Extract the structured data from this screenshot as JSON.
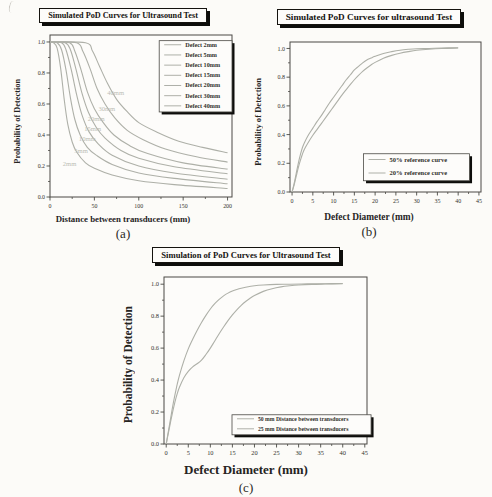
{
  "colors": {
    "paper": "#fdfcfa",
    "axis": "#4a4944",
    "tick_text": "#33322d",
    "curve": "#aeb0a8",
    "inline_label": "#bcbdb5",
    "legend_shadow": "#0d0d0b",
    "title_text": "#151310"
  },
  "chart_data": [
    {
      "id": "a",
      "type": "line",
      "title": "Simulated PoD Curves for Ultrasound Test",
      "xlabel": "Distance between transducers (mm)",
      "ylabel": "Probability of Detection",
      "caption": "(a)",
      "xlim": [
        0,
        205
      ],
      "ylim": [
        0,
        1.045
      ],
      "xticks": [
        0,
        50,
        100,
        150,
        200
      ],
      "xtick_labels": [
        "0",
        "50",
        "100",
        "150",
        "200"
      ],
      "yticks": [
        0,
        0.2,
        0.4,
        0.6,
        0.8,
        1.0
      ],
      "ytick_labels": [
        "0.0",
        "0.2",
        "0.4",
        "0.6",
        "0.8",
        "1.0"
      ],
      "xtick_minor": 25,
      "ytick_minor": 0.1,
      "grid": false,
      "legend": {
        "position_fraction": [
          0.6,
          0.035,
          0.4,
          0.44
        ],
        "entries": [
          "Defect 2mm",
          "Defect 5mm",
          "Defect 10mm",
          "Defect 15mm",
          "Defect 20mm",
          "Defect 30mm",
          "Defect 40mm"
        ]
      },
      "inline_labels": [
        {
          "text": "40mm",
          "x": 74,
          "y": 0.655
        },
        {
          "text": "30mm",
          "x": 64,
          "y": 0.555
        },
        {
          "text": "20mm",
          "x": 52,
          "y": 0.49
        },
        {
          "text": "15mm",
          "x": 48,
          "y": 0.425
        },
        {
          "text": "10mm",
          "x": 42,
          "y": 0.362
        },
        {
          "text": "5mm",
          "x": 35,
          "y": 0.283
        },
        {
          "text": "2mm",
          "x": 22,
          "y": 0.203
        }
      ],
      "series": [
        {
          "name": "Defect 2mm",
          "points": [
            [
              0,
              1
            ],
            [
              4,
              0.995
            ],
            [
              8,
              0.96
            ],
            [
              12,
              0.83
            ],
            [
              16,
              0.63
            ],
            [
              20,
              0.47
            ],
            [
              25,
              0.355
            ],
            [
              30,
              0.29
            ],
            [
              40,
              0.22
            ],
            [
              50,
              0.185
            ],
            [
              70,
              0.142
            ],
            [
              100,
              0.105
            ],
            [
              140,
              0.08
            ],
            [
              200,
              0.055
            ]
          ]
        },
        {
          "name": "Defect 5mm",
          "points": [
            [
              0,
              1
            ],
            [
              8,
              0.995
            ],
            [
              13,
              0.95
            ],
            [
              18,
              0.82
            ],
            [
              23,
              0.64
            ],
            [
              28,
              0.5
            ],
            [
              34,
              0.4
            ],
            [
              42,
              0.32
            ],
            [
              52,
              0.27
            ],
            [
              70,
              0.21
            ],
            [
              100,
              0.155
            ],
            [
              140,
              0.12
            ],
            [
              200,
              0.085
            ]
          ]
        },
        {
          "name": "Defect 10mm",
          "points": [
            [
              0,
              1
            ],
            [
              13,
              0.995
            ],
            [
              18,
              0.95
            ],
            [
              24,
              0.82
            ],
            [
              30,
              0.66
            ],
            [
              36,
              0.53
            ],
            [
              44,
              0.42
            ],
            [
              54,
              0.345
            ],
            [
              70,
              0.27
            ],
            [
              100,
              0.2
            ],
            [
              140,
              0.155
            ],
            [
              200,
              0.115
            ]
          ]
        },
        {
          "name": "Defect 15mm",
          "points": [
            [
              0,
              1
            ],
            [
              17,
              0.995
            ],
            [
              23,
              0.95
            ],
            [
              29,
              0.83
            ],
            [
              36,
              0.67
            ],
            [
              43,
              0.55
            ],
            [
              52,
              0.45
            ],
            [
              62,
              0.38
            ],
            [
              80,
              0.3
            ],
            [
              100,
              0.25
            ],
            [
              140,
              0.195
            ],
            [
              200,
              0.15
            ]
          ]
        },
        {
          "name": "Defect 20mm",
          "points": [
            [
              0,
              1
            ],
            [
              22,
              0.995
            ],
            [
              28,
              0.94
            ],
            [
              35,
              0.82
            ],
            [
              42,
              0.68
            ],
            [
              50,
              0.57
            ],
            [
              60,
              0.48
            ],
            [
              72,
              0.4
            ],
            [
              90,
              0.33
            ],
            [
              110,
              0.28
            ],
            [
              150,
              0.22
            ],
            [
              200,
              0.18
            ]
          ]
        },
        {
          "name": "Defect 30mm",
          "points": [
            [
              0,
              1
            ],
            [
              30,
              0.995
            ],
            [
              37,
              0.94
            ],
            [
              45,
              0.83
            ],
            [
              53,
              0.7
            ],
            [
              62,
              0.6
            ],
            [
              73,
              0.51
            ],
            [
              87,
              0.43
            ],
            [
              105,
              0.37
            ],
            [
              130,
              0.31
            ],
            [
              165,
              0.26
            ],
            [
              200,
              0.225
            ]
          ]
        },
        {
          "name": "Defect 40mm",
          "points": [
            [
              0,
              1
            ],
            [
              40,
              0.995
            ],
            [
              48,
              0.94
            ],
            [
              56,
              0.84
            ],
            [
              65,
              0.73
            ],
            [
              75,
              0.63
            ],
            [
              87,
              0.55
            ],
            [
              100,
              0.48
            ],
            [
              120,
              0.42
            ],
            [
              145,
              0.36
            ],
            [
              172,
              0.32
            ],
            [
              200,
              0.285
            ]
          ]
        }
      ]
    },
    {
      "id": "b",
      "type": "line",
      "title": "Simulated PoD Curves for ultrasound Test",
      "xlabel": "Defect Diameter (mm)",
      "ylabel": "Probability of Detection",
      "caption": "(b)",
      "xlim": [
        -0.5,
        45.5
      ],
      "ylim": [
        0,
        1.045
      ],
      "xticks": [
        0,
        5,
        10,
        15,
        20,
        25,
        30,
        35,
        40,
        45
      ],
      "xtick_labels": [
        "0",
        "5",
        "10",
        "15",
        "20",
        "25",
        "30",
        "35",
        "40",
        "45"
      ],
      "yticks": [
        0,
        0.2,
        0.4,
        0.6,
        0.8,
        1.0
      ],
      "ytick_labels": [
        "0.0",
        "0.2",
        "0.4",
        "0.6",
        "0.8",
        "1.0"
      ],
      "xtick_minor": 2.5,
      "ytick_minor": 0.1,
      "grid": false,
      "legend": {
        "position_fraction": [
          0.385,
          0.745,
          0.555,
          0.18
        ],
        "entries": [
          "50% reference curve",
          "20% reference curve"
        ]
      },
      "inline_labels": [],
      "series": [
        {
          "name": "50% reference curve",
          "points": [
            [
              0,
              0
            ],
            [
              0.5,
              0.06
            ],
            [
              1,
              0.13
            ],
            [
              1.5,
              0.2
            ],
            [
              2,
              0.26
            ],
            [
              2.5,
              0.31
            ],
            [
              3,
              0.345
            ],
            [
              4,
              0.4
            ],
            [
              5,
              0.445
            ],
            [
              6,
              0.49
            ],
            [
              7,
              0.53
            ],
            [
              8,
              0.575
            ],
            [
              9,
              0.62
            ],
            [
              10,
              0.66
            ],
            [
              11,
              0.7
            ],
            [
              12,
              0.74
            ],
            [
              13,
              0.78
            ],
            [
              14,
              0.815
            ],
            [
              15,
              0.85
            ],
            [
              16,
              0.875
            ],
            [
              17,
              0.9
            ],
            [
              18,
              0.92
            ],
            [
              19,
              0.933
            ],
            [
              20,
              0.945
            ],
            [
              22,
              0.965
            ],
            [
              24,
              0.978
            ],
            [
              26,
              0.988
            ],
            [
              28,
              0.994
            ],
            [
              30,
              0.998
            ],
            [
              33,
              1.0
            ],
            [
              36,
              1.003
            ],
            [
              40,
              1.005
            ]
          ]
        },
        {
          "name": "20% reference curve",
          "points": [
            [
              0,
              0
            ],
            [
              0.5,
              0.05
            ],
            [
              1,
              0.11
            ],
            [
              1.5,
              0.17
            ],
            [
              2,
              0.22
            ],
            [
              2.5,
              0.265
            ],
            [
              3,
              0.3
            ],
            [
              4,
              0.35
            ],
            [
              5,
              0.395
            ],
            [
              6,
              0.435
            ],
            [
              7,
              0.475
            ],
            [
              8,
              0.515
            ],
            [
              9,
              0.555
            ],
            [
              10,
              0.595
            ],
            [
              11,
              0.635
            ],
            [
              12,
              0.675
            ],
            [
              13,
              0.712
            ],
            [
              14,
              0.748
            ],
            [
              15,
              0.782
            ],
            [
              16,
              0.812
            ],
            [
              17,
              0.84
            ],
            [
              18,
              0.864
            ],
            [
              19,
              0.885
            ],
            [
              20,
              0.903
            ],
            [
              22,
              0.932
            ],
            [
              24,
              0.952
            ],
            [
              26,
              0.967
            ],
            [
              28,
              0.978
            ],
            [
              30,
              0.987
            ],
            [
              33,
              0.995
            ],
            [
              36,
              1.0
            ],
            [
              40,
              1.003
            ]
          ]
        }
      ]
    },
    {
      "id": "c",
      "type": "line",
      "title": "Simulation of PoD Curves for Ultrasound Test",
      "xlabel": "Defect Diameter (mm)",
      "ylabel": "Probability of Detection",
      "caption": "(c)",
      "xlim": [
        -0.5,
        45.5
      ],
      "ylim": [
        0,
        1.045
      ],
      "xticks": [
        0,
        5,
        10,
        15,
        20,
        25,
        30,
        35,
        40,
        45
      ],
      "xtick_labels": [
        "0",
        "5",
        "10",
        "15",
        "20",
        "25",
        "30",
        "35",
        "40",
        "45"
      ],
      "yticks": [
        0,
        0.2,
        0.4,
        0.6,
        0.8,
        1.0
      ],
      "ytick_labels": [
        "0.0",
        "0.2",
        "0.4",
        "0.6",
        "0.8",
        "1.0"
      ],
      "xtick_minor": 2.5,
      "ytick_minor": 0.1,
      "grid": false,
      "legend": {
        "position_fraction": [
          0.335,
          0.825,
          0.685,
          0.12
        ],
        "entries": [
          "50 mm Distance between transducers",
          "25 mm Distance between transducers"
        ]
      },
      "inline_labels": [],
      "series": [
        {
          "name": "50 mm Distance between transducers",
          "points": [
            [
              0,
              0
            ],
            [
              0.5,
              0.08
            ],
            [
              1,
              0.16
            ],
            [
              1.5,
              0.24
            ],
            [
              2,
              0.31
            ],
            [
              2.5,
              0.375
            ],
            [
              3,
              0.43
            ],
            [
              4,
              0.52
            ],
            [
              5,
              0.595
            ],
            [
              6,
              0.655
            ],
            [
              7,
              0.71
            ],
            [
              8,
              0.76
            ],
            [
              9,
              0.805
            ],
            [
              10,
              0.845
            ],
            [
              11,
              0.878
            ],
            [
              12,
              0.905
            ],
            [
              13,
              0.927
            ],
            [
              14,
              0.944
            ],
            [
              15,
              0.957
            ],
            [
              16,
              0.967
            ],
            [
              17,
              0.975
            ],
            [
              18,
              0.981
            ],
            [
              20,
              0.99
            ],
            [
              22,
              0.995
            ],
            [
              25,
              0.999
            ],
            [
              28,
              1.0
            ],
            [
              32,
              1.002
            ],
            [
              36,
              1.003
            ],
            [
              40,
              1.004
            ]
          ]
        },
        {
          "name": "25 mm Distance between transducers",
          "points": [
            [
              0,
              0
            ],
            [
              0.5,
              0.07
            ],
            [
              1,
              0.14
            ],
            [
              1.5,
              0.205
            ],
            [
              2,
              0.265
            ],
            [
              2.5,
              0.315
            ],
            [
              3,
              0.355
            ],
            [
              4,
              0.415
            ],
            [
              5,
              0.455
            ],
            [
              6,
              0.483
            ],
            [
              7,
              0.502
            ],
            [
              8,
              0.525
            ],
            [
              9,
              0.56
            ],
            [
              10,
              0.6
            ],
            [
              11,
              0.645
            ],
            [
              12,
              0.69
            ],
            [
              13,
              0.732
            ],
            [
              14,
              0.772
            ],
            [
              15,
              0.808
            ],
            [
              16,
              0.84
            ],
            [
              17,
              0.868
            ],
            [
              18,
              0.892
            ],
            [
              19,
              0.912
            ],
            [
              20,
              0.929
            ],
            [
              22,
              0.955
            ],
            [
              24,
              0.972
            ],
            [
              26,
              0.983
            ],
            [
              28,
              0.99
            ],
            [
              30,
              0.995
            ],
            [
              33,
              0.999
            ],
            [
              36,
              1.001
            ],
            [
              40,
              1.003
            ]
          ]
        }
      ]
    }
  ]
}
